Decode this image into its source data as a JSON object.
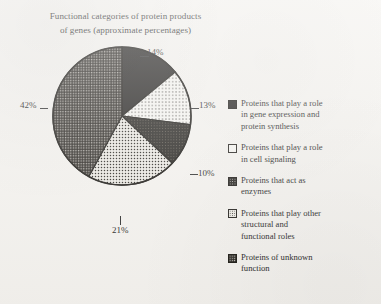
{
  "figure": {
    "title_line1": "Functional categories of protein products",
    "title_line2": "of genes (approximate percentages)"
  },
  "chart_data": {
    "type": "pie",
    "title": "Functional categories of protein products of genes (approximate percentages)",
    "xlabel": "",
    "ylabel": "",
    "grid": false,
    "legend_position": "right",
    "total": 100,
    "units": "percent",
    "start_angle_deg": 0,
    "direction": "clockwise",
    "categories": [
      "Proteins that play a role in gene expression and protein synthesis",
      "Proteins that play a role in cell signaling",
      "Proteins that act as enzymes",
      "Proteins that play other structural and functional roles",
      "Proteins of unknown function"
    ],
    "values": [
      14,
      13,
      10,
      21,
      42
    ],
    "slices": [
      {
        "label": "14%",
        "value": 14,
        "category": "Proteins that play a role in gene expression and protein synthesis",
        "pattern": "solid-dark",
        "fill": "#1c1a18"
      },
      {
        "label": "13%",
        "value": 13,
        "category": "Proteins that play a role in cell signaling",
        "pattern": "light-open",
        "fill": "#f6f5f1"
      },
      {
        "label": "10%",
        "value": 10,
        "category": "Proteins that act as enzymes",
        "pattern": "dark-textured",
        "fill": "#211f1b"
      },
      {
        "label": "21%",
        "value": 21,
        "category": "Proteins that play other structural and functional roles",
        "pattern": "light-dotted",
        "fill": "#eceae4"
      },
      {
        "label": "42%",
        "value": 42,
        "category": "Proteins of unknown function",
        "pattern": "gray-checker",
        "fill": "#3e3b35"
      }
    ],
    "data_labels": [
      "14%",
      "13%",
      "10%",
      "21%",
      "42%"
    ]
  },
  "legend": {
    "items": [
      {
        "swatch": "solid-dark",
        "line1": "Proteins that play a role",
        "line2": "in gene expression and",
        "line3": "protein synthesis"
      },
      {
        "swatch": "light-open",
        "line1": "Proteins that play a role",
        "line2": "in cell signaling",
        "line3": ""
      },
      {
        "swatch": "dark-textured",
        "line1": "Proteins that act as",
        "line2": "enzymes",
        "line3": ""
      },
      {
        "swatch": "light-dotted",
        "line1": "Proteins that play other",
        "line2": "structural and",
        "line3": "functional roles"
      },
      {
        "swatch": "gray-checker",
        "line1": "Proteins of unknown",
        "line2": "function",
        "line3": ""
      }
    ]
  }
}
